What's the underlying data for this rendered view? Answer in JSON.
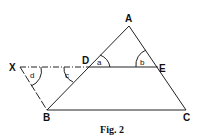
{
  "figure": {
    "caption": "Fig. 2",
    "points": {
      "A": {
        "label": "A",
        "x": 129,
        "y": 26
      },
      "X": {
        "label": "X",
        "x": 20,
        "y": 67
      },
      "D": {
        "label": "D",
        "x": 88,
        "y": 67
      },
      "E": {
        "label": "E",
        "x": 158,
        "y": 67
      },
      "B": {
        "label": "B",
        "x": 47,
        "y": 110
      },
      "C": {
        "label": "C",
        "x": 186,
        "y": 110
      }
    },
    "angles": {
      "a": "a",
      "b": "b",
      "c": "c",
      "d": "d"
    },
    "segments": [
      "AB",
      "AC",
      "BC",
      "XE",
      "XB"
    ],
    "dashed_segment": "XD",
    "colors": {
      "stroke": "#222222",
      "background": "#ffffff"
    }
  }
}
